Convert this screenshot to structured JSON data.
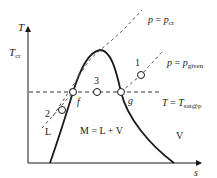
{
  "diagram": {
    "type": "T-s phase diagram",
    "axes": {
      "y_label": "T",
      "x_label": "s",
      "y_tick_label": "T",
      "y_tick_sub": "cr"
    },
    "lines": {
      "critical_isobar": {
        "lhs": "p",
        "eq": " = ",
        "rhs": "p",
        "sub": "cr"
      },
      "given_isobar": {
        "lhs": "p",
        "eq": " = ",
        "rhs": "p",
        "sub": "given"
      },
      "saturation_isotherm": {
        "lhs": "T",
        "eq": " = ",
        "rhs": "T",
        "sub": "sat@p"
      }
    },
    "points": {
      "p1": "1",
      "p2": "2",
      "p3": "3",
      "f": "f",
      "g": "g"
    },
    "regions": {
      "liquid": "L",
      "mixture": "M = L + V",
      "vapor": "V"
    },
    "colors": {
      "stroke": "#1a1a1a",
      "dashed": "#333333",
      "background": "#ffffff"
    }
  }
}
